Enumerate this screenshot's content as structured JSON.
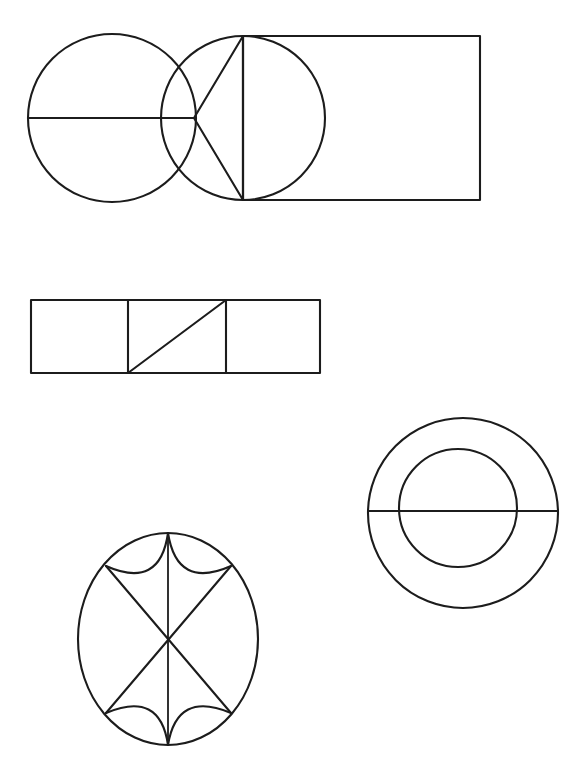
{
  "page": {
    "background_color": "#ffffff",
    "stroke_color": "#1c1c1c",
    "width": 578,
    "height": 768
  },
  "figures": [
    {
      "id": "figure-top-circle-triangle-rect",
      "name": "circle-bowtie-rectangle-composite",
      "label": "Top composite: circle with diameter, left-pointing triangle, circle inscribed on rectangle edge",
      "parts": [
        {
          "name": "left-circle",
          "shape": "circle",
          "cx": 112,
          "cy": 118,
          "r": 84
        },
        {
          "name": "left-circle-diameter",
          "shape": "line",
          "x1": 28,
          "y1": 118,
          "x2": 196,
          "y2": 118
        },
        {
          "name": "triangle",
          "shape": "polygon",
          "points": "194,118 243,36 243,200"
        },
        {
          "name": "rectangle",
          "shape": "rect",
          "x": 243,
          "y": 36,
          "width": 237,
          "height": 164
        },
        {
          "name": "inscribed-circle",
          "shape": "circle",
          "cx": 243,
          "cy": 118,
          "r": 82
        },
        {
          "name": "rectangle-left-edge",
          "shape": "line",
          "x1": 243,
          "y1": 36,
          "x2": 243,
          "y2": 200
        }
      ]
    },
    {
      "id": "figure-middle-three-cell-bar",
      "name": "three-cell-rectangle-with-diagonal",
      "label": "Middle figure: horizontal rectangle split into three cells, diagonal in the middle cell",
      "parts": [
        {
          "name": "outer-rectangle",
          "shape": "rect",
          "x": 31,
          "y": 300,
          "width": 289,
          "height": 73
        },
        {
          "name": "divider-left",
          "shape": "line",
          "x1": 128,
          "y1": 300,
          "x2": 128,
          "y2": 373
        },
        {
          "name": "divider-right",
          "shape": "line",
          "x1": 226,
          "y1": 300,
          "x2": 226,
          "y2": 373
        },
        {
          "name": "middle-cell-diagonal",
          "shape": "line",
          "x1": 128,
          "y1": 373,
          "x2": 226,
          "y2": 300
        }
      ],
      "cell_count": 3
    },
    {
      "id": "figure-annulus",
      "name": "concentric-circles-with-diameter",
      "label": "Right figure: two concentric circles (annulus / donut) crossed by a horizontal diameter",
      "parts": [
        {
          "name": "outer-circle",
          "shape": "circle",
          "cx": 463,
          "cy": 513,
          "r": 95
        },
        {
          "name": "inner-circle",
          "shape": "circle",
          "cx": 458,
          "cy": 508,
          "r": 59
        },
        {
          "name": "horizontal-diameter",
          "shape": "line",
          "x1": 368,
          "y1": 511,
          "x2": 558,
          "y2": 511
        }
      ]
    },
    {
      "id": "figure-ellipse-rosette",
      "name": "ellipse-with-crossed-chords-and-arcs",
      "label": "Bottom-left figure: ellipse with vertical diameter, two crossing diagonals and four inner arcs",
      "parts": [
        {
          "name": "outer-ellipse",
          "shape": "ellipse",
          "cx": 168,
          "cy": 639,
          "rx": 90,
          "ry": 106
        },
        {
          "name": "vertical-diameter",
          "shape": "line",
          "x1": 168,
          "y1": 533,
          "x2": 168,
          "y2": 745
        },
        {
          "name": "diagonal-nw-se",
          "shape": "line",
          "x1": 106,
          "y1": 566,
          "x2": 231,
          "y2": 713
        },
        {
          "name": "diagonal-ne-sw",
          "shape": "line",
          "x1": 231,
          "y1": 566,
          "x2": 106,
          "y2": 713
        },
        {
          "name": "arc-top-left",
          "shape": "arc",
          "from": "168,533",
          "to": "106,566"
        },
        {
          "name": "arc-top-right",
          "shape": "arc",
          "from": "168,533",
          "to": "231,566"
        },
        {
          "name": "arc-bottom-left",
          "shape": "arc",
          "from": "168,745",
          "to": "106,713"
        },
        {
          "name": "arc-bottom-right",
          "shape": "arc",
          "from": "168,745",
          "to": "231,713"
        }
      ],
      "arc_count": 4,
      "diagonal_count": 2
    }
  ]
}
